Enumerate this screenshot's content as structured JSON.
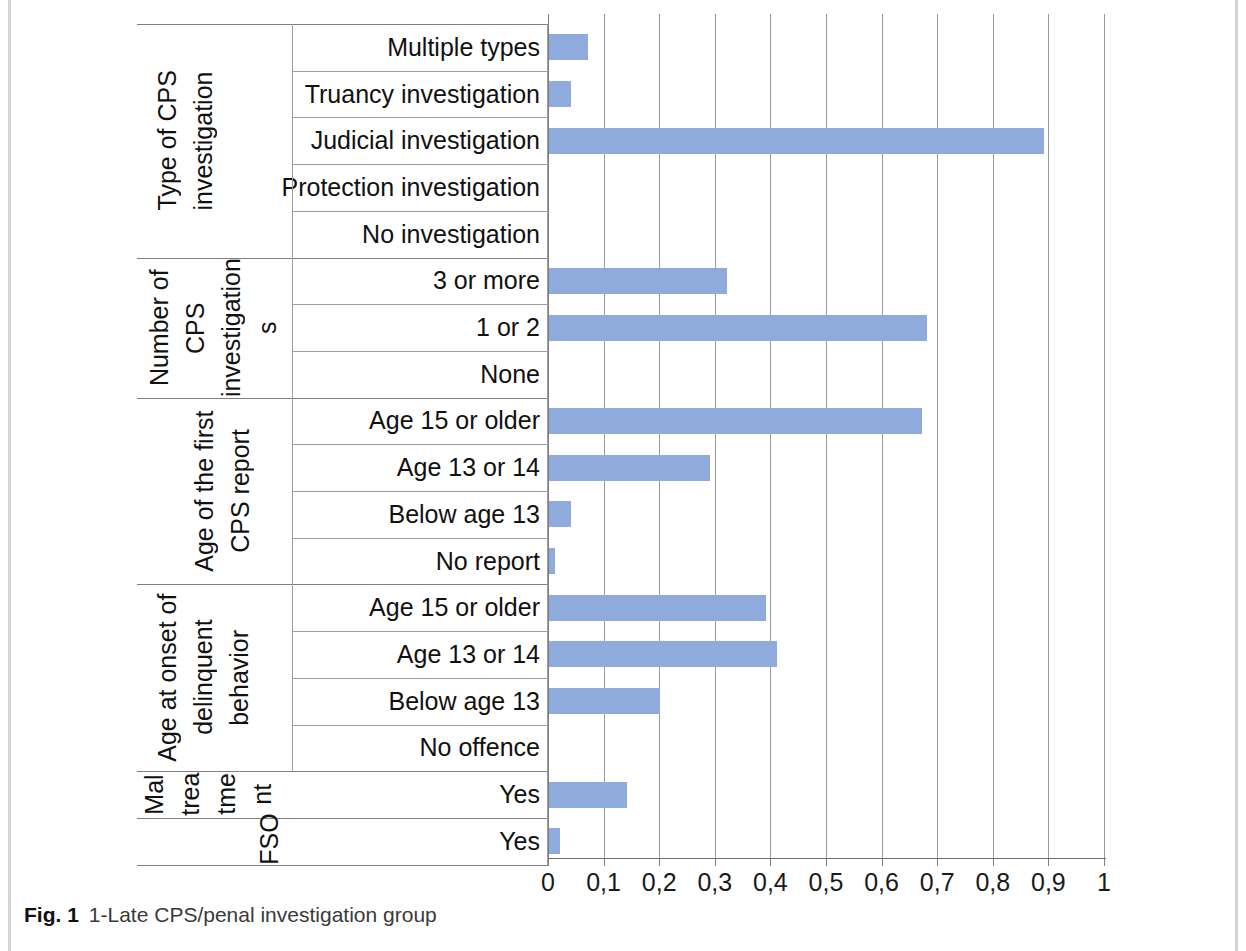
{
  "figure": {
    "caption_label": "Fig. 1",
    "caption_text": "1-Late CPS/penal investigation group"
  },
  "colors": {
    "bar": "#8faadc",
    "grid": "#9a9a9a",
    "text": "#111111",
    "caption": "#3a3a3a"
  },
  "chart_data": {
    "type": "bar",
    "orientation": "horizontal",
    "title": "1-Late CPS/penal investigation group",
    "xlabel": "",
    "ylabel": "",
    "xlim": [
      0,
      1
    ],
    "grid": true,
    "legend": "none",
    "decimal_separator": ",",
    "xticks": [
      0,
      0.1,
      0.2,
      0.3,
      0.4,
      0.5,
      0.6,
      0.7,
      0.8,
      0.9,
      1
    ],
    "xtick_labels": [
      "0",
      "0,1",
      "0,2",
      "0,3",
      "0,4",
      "0,5",
      "0,6",
      "0,7",
      "0,8",
      "0,9",
      "1"
    ],
    "groups": [
      {
        "name": "Type of CPS investigation",
        "rotated_label_lines": [
          "Type of CPS",
          "investigation"
        ],
        "categories": [
          "Multiple types",
          "Truancy investigation",
          "Judicial investigation",
          "Protection investigation",
          "No investigation"
        ],
        "values": [
          0.07,
          0.04,
          0.89,
          0.0,
          0.0
        ]
      },
      {
        "name": "Number of CPS investigations",
        "rotated_label_lines": [
          "Number of",
          "CPS",
          "investigation",
          "s"
        ],
        "categories": [
          "3 or more",
          "1 or 2",
          "None"
        ],
        "values": [
          0.32,
          0.68,
          0.0
        ]
      },
      {
        "name": "Age of the first CPS report",
        "rotated_label_lines": [
          "Age of the first",
          "CPS report"
        ],
        "categories": [
          "Age 15 or older",
          "Age 13 or 14",
          "Below age 13",
          "No report"
        ],
        "values": [
          0.67,
          0.29,
          0.04,
          0.01
        ]
      },
      {
        "name": "Age at onset of delinquent behavior",
        "rotated_label_lines": [
          "Age at onset of",
          "delinquent",
          "behavior"
        ],
        "categories": [
          "Age 15 or older",
          "Age 13 or 14",
          "Below age 13",
          "No offence"
        ],
        "values": [
          0.39,
          0.41,
          0.2,
          0.0
        ]
      },
      {
        "name": "Maltreatment",
        "rotated_label_lines": [
          "Mal",
          "trea",
          "tme",
          "nt"
        ],
        "categories": [
          "Yes"
        ],
        "values": [
          0.14
        ]
      },
      {
        "name": "FSO",
        "rotated_label_lines": [
          "FSO"
        ],
        "categories": [
          "Yes"
        ],
        "values": [
          0.02
        ]
      }
    ]
  },
  "rows": [
    {
      "label": "Multiple types",
      "value": 0.07
    },
    {
      "label": "Truancy investigation",
      "value": 0.04
    },
    {
      "label": "Judicial investigation",
      "value": 0.89
    },
    {
      "label": "Protection investigation",
      "value": 0.0
    },
    {
      "label": "No investigation",
      "value": 0.0
    },
    {
      "label": "3 or more",
      "value": 0.32
    },
    {
      "label": "1 or 2",
      "value": 0.68
    },
    {
      "label": "None",
      "value": 0.0
    },
    {
      "label": "Age 15 or older",
      "value": 0.67
    },
    {
      "label": "Age 13 or 14",
      "value": 0.29
    },
    {
      "label": "Below age 13",
      "value": 0.04
    },
    {
      "label": "No report",
      "value": 0.01
    },
    {
      "label": "Age 15 or older",
      "value": 0.39
    },
    {
      "label": "Age 13 or 14",
      "value": 0.41
    },
    {
      "label": "Below age 13",
      "value": 0.2
    },
    {
      "label": "No offence",
      "value": 0.0
    },
    {
      "label": "Yes",
      "value": 0.14
    },
    {
      "label": "Yes",
      "value": 0.02
    }
  ],
  "group_labels": {
    "type_cps_line1": "Type of CPS",
    "type_cps_line2": "investigation",
    "num_cps_line1": "Number of",
    "num_cps_line2": "CPS",
    "num_cps_line3": "investigation",
    "num_cps_line4": "s",
    "age_first_line1": "Age of the first",
    "age_first_line2": "CPS report",
    "onset_line1": "Age at onset of",
    "onset_line2": "delinquent",
    "onset_line3": "behavior",
    "malt_line1": "Mal",
    "malt_line2": "trea",
    "malt_line3": "tme",
    "malt_line4": "nt",
    "fso": "FSO"
  },
  "xtick_labels": [
    "0",
    "0,1",
    "0,2",
    "0,3",
    "0,4",
    "0,5",
    "0,6",
    "0,7",
    "0,8",
    "0,9",
    "1"
  ]
}
